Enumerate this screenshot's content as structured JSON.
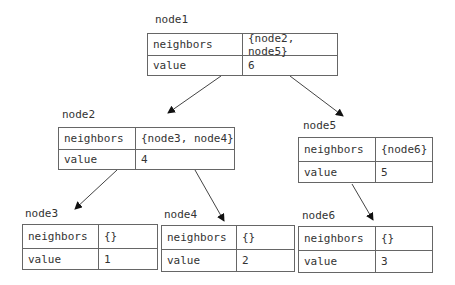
{
  "row_labels": {
    "neighbors": "neighbors",
    "value": "value"
  },
  "nodes": [
    {
      "id": "node1",
      "name": "node1",
      "neighbors": "{node2, node5}",
      "value": "6"
    },
    {
      "id": "node2",
      "name": "node2",
      "neighbors": "{node3, node4}",
      "value": "4"
    },
    {
      "id": "node5",
      "name": "node5",
      "neighbors": "{node6}",
      "value": "5"
    },
    {
      "id": "node3",
      "name": "node3",
      "neighbors": "{}",
      "value": "1"
    },
    {
      "id": "node4",
      "name": "node4",
      "neighbors": "{}",
      "value": "2"
    },
    {
      "id": "node6",
      "name": "node6",
      "neighbors": "{}",
      "value": "3"
    }
  ],
  "edges": [
    {
      "from": "node1",
      "to": "node2"
    },
    {
      "from": "node1",
      "to": "node5"
    },
    {
      "from": "node2",
      "to": "node3"
    },
    {
      "from": "node2",
      "to": "node4"
    },
    {
      "from": "node5",
      "to": "node6"
    }
  ]
}
